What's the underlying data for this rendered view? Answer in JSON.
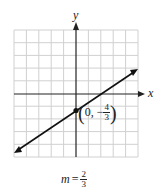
{
  "axes": {
    "x_label": "x",
    "y_label": "y"
  },
  "grid": {
    "cols": 10,
    "rows": 10,
    "xmin": -5,
    "xmax": 5,
    "ymin": -5,
    "ymax": 5
  },
  "point": {
    "prefix": "0, −",
    "num": "4",
    "den": "3"
  },
  "slope": {
    "var": "m",
    "eq": "=",
    "num": "2",
    "den": "3"
  },
  "colors": {
    "grid": "#d0d0d0",
    "axis": "#222222",
    "line": "#111111"
  }
}
